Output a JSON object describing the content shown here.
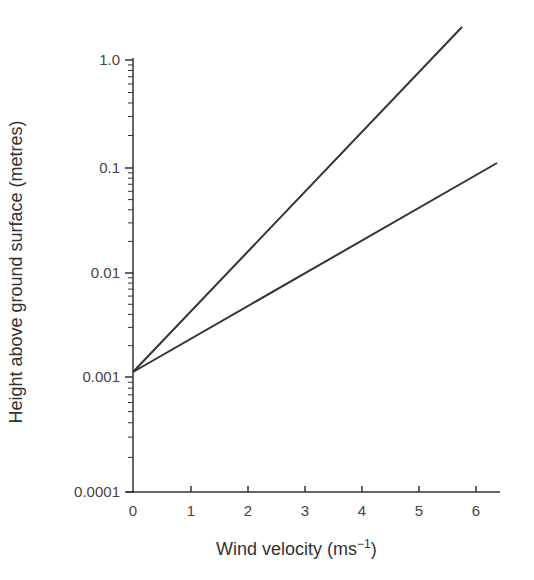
{
  "chart_data": {
    "type": "line",
    "title": "",
    "xlabel": "Wind velocity (ms",
    "xlabel_superscript": "−1",
    "xlabel_close": ")",
    "ylabel": "Height above ground surface (metres)",
    "x_ticks": [
      "0",
      "1",
      "2",
      "3",
      "4",
      "5",
      "6"
    ],
    "y_ticks": [
      "1.0",
      "0.1",
      "0.01",
      "0.001",
      "0.0001"
    ],
    "y_scale": "log",
    "xlim": [
      0,
      6.5
    ],
    "ylim": [
      0.0001,
      2.0
    ],
    "grid": false,
    "legend": null,
    "series": [
      {
        "name": "steep profile",
        "x": [
          0,
          5.77
        ],
        "y": [
          0.0012,
          2.0
        ]
      },
      {
        "name": "shallow profile",
        "x": [
          0,
          6.4
        ],
        "y": [
          0.0012,
          0.11
        ]
      }
    ]
  }
}
